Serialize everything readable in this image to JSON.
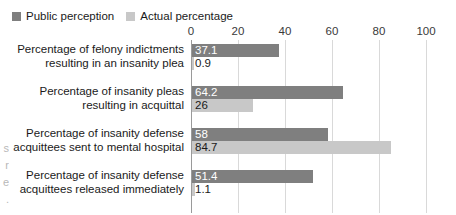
{
  "chart_data": {
    "type": "bar",
    "orientation": "horizontal",
    "title": "",
    "xlabel": "",
    "ylabel": "",
    "xlim": [
      0,
      100
    ],
    "xticks": [
      0,
      20,
      40,
      60,
      80,
      100
    ],
    "grid": true,
    "legend_position": "top-left",
    "categories": [
      "Percentage of felony indictments resulting in an insanity plea",
      "Percentage of insanity pleas resulting in acquittal",
      "Percentage of insanity defense acquittees sent to mental hospital",
      "Percentage of insanity defense acquittees released immediately"
    ],
    "category_lines": [
      [
        "Percentage of felony indictments",
        "resulting in an insanity plea"
      ],
      [
        "Percentage of insanity pleas",
        "resulting in acquittal"
      ],
      [
        "Percentage of insanity defense",
        "acquittees sent to mental hospital"
      ],
      [
        "Percentage of insanity defense",
        "acquittees released immediately"
      ]
    ],
    "series": [
      {
        "name": "Public perception",
        "color": "#7f7f7f",
        "values": [
          37.1,
          64.2,
          58,
          51.4
        ],
        "labels": [
          "37.1",
          "64.2",
          "58",
          "51.4"
        ]
      },
      {
        "name": "Actual percentage",
        "color": "#c8c8c8",
        "values": [
          0.9,
          26,
          84.7,
          1.1
        ],
        "labels": [
          "0.9",
          "26",
          "84.7",
          "1.1"
        ]
      }
    ]
  },
  "legend": {
    "items": [
      {
        "label": "Public perception",
        "color": "#7f7f7f"
      },
      {
        "label": "Actual percentage",
        "color": "#c8c8c8"
      }
    ]
  },
  "axis": {
    "tick_labels": [
      "0",
      "20",
      "40",
      "60",
      "80",
      "100"
    ]
  },
  "edge_clip_text": "s r e ."
}
